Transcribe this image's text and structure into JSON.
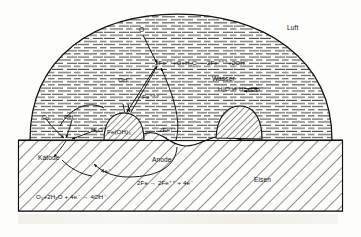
{
  "figure": {
    "regions": {
      "air_label": "Luft",
      "water_label": "Wasser",
      "metal_label": "Eisen"
    },
    "species": {
      "oxygen_top": "O",
      "hydroxide_mid": "OH⁻",
      "ferric": "Fe⁺⁺⁺",
      "oxygen_left": "O₂",
      "hydroxide_left": "OH⁻",
      "water_left": "H₂O",
      "rust": "Fe(OH)₃",
      "ferrous": "2Fe⁺⁺",
      "electrons": "4e⁻"
    },
    "electrodes": {
      "cathode": "Katode",
      "anode": "Anode"
    },
    "equations": {
      "ferric_formation": "2Fe⁺⁺+O+H₂O → 2Fe⁺⁺⁺+2OH⁻",
      "water_dissociation": "H₂O ⇌ H⁺+OH⁻",
      "anodic": "2Fe → 2Fe⁺⁺ + 4e⁻",
      "cathodic": "O₂+2H₂O + 4e⁻ → 4OH⁻"
    },
    "colors": {
      "ink": "#111111",
      "paper": "#fdfdfb",
      "hatch": "#2a2a2a",
      "ghost": "#d8d3cb"
    },
    "ghost_text": {
      "line1": "Wasser",
      "line2": "die"
    }
  }
}
